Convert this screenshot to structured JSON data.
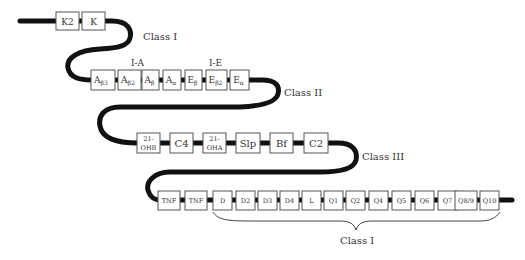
{
  "rows": [
    {
      "id": "row1",
      "genes": [
        {
          "main": "K2",
          "sub": ""
        },
        {
          "main": "K",
          "sub": ""
        }
      ]
    },
    {
      "id": "row2",
      "group_labels": [
        "I-A",
        "I-E"
      ],
      "genes": [
        {
          "main": "A",
          "sub": "β3"
        },
        {
          "main": "A",
          "sub": "β2"
        },
        {
          "main": "A",
          "sub": "β"
        },
        {
          "main": "A",
          "sub": "α"
        },
        {
          "main": "E",
          "sub": "β"
        },
        {
          "main": "E",
          "sub": "β2"
        },
        {
          "main": "E",
          "sub": "α"
        }
      ]
    },
    {
      "id": "row3",
      "genes": [
        {
          "main": "21-",
          "line2": "OHB"
        },
        {
          "main": "C4"
        },
        {
          "main": "21-",
          "line2": "OHA"
        },
        {
          "main": "Slp"
        },
        {
          "main": "Bf"
        },
        {
          "main": "C2"
        }
      ]
    },
    {
      "id": "row4",
      "genes": [
        {
          "main": "TNF"
        },
        {
          "main": "TNF"
        },
        {
          "main": "D"
        },
        {
          "main": "D2"
        },
        {
          "main": "D3"
        },
        {
          "main": "D4"
        },
        {
          "main": "L"
        },
        {
          "main": "Q1"
        },
        {
          "main": "Q2"
        },
        {
          "main": "Q4"
        },
        {
          "main": "Q5"
        },
        {
          "main": "Q6"
        },
        {
          "main": "Q7"
        },
        {
          "main": "Q8/9"
        },
        {
          "main": "Q10"
        }
      ]
    }
  ],
  "class_labels": {
    "class1_top": "Class I",
    "class2": "Class II",
    "class3": "Class III",
    "class1_bottom": "Class I"
  }
}
